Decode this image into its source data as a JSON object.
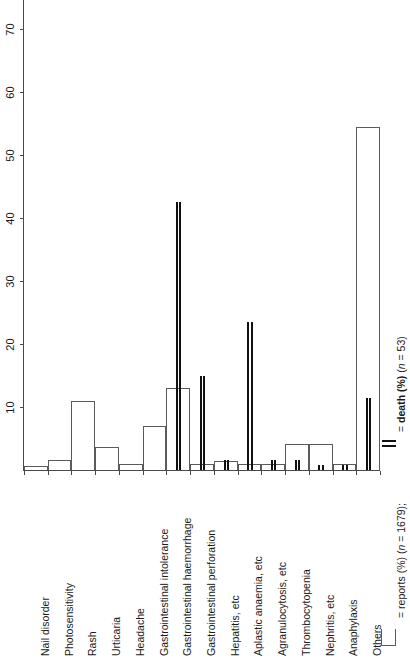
{
  "chart_data": {
    "type": "bar",
    "orientation": "vertical-bars-rotated-labels",
    "title": "",
    "subtitle": "",
    "xlabel": "",
    "ylabel": "",
    "ylim": [
      0,
      75
    ],
    "yticks": [
      10,
      20,
      30,
      40,
      50,
      60,
      70
    ],
    "ytick_labels": [
      "10",
      "20",
      "30",
      "40",
      "50",
      "60",
      "70"
    ],
    "grid": false,
    "legend_position": "bottom-right",
    "categories": [
      "Nail disorder",
      "Photosensitivity",
      "Rash",
      "Urticaria",
      "Headache",
      "Gastrointestinal intolerance",
      "Gastrointestinal haemorrhage",
      "Gastrointestinal perforation",
      "Hepatitis, etc",
      "Aplastic anaemia, etc",
      "Agranulocytosis, etc",
      "Thrombocytopenia",
      "Nephritis, etc",
      "Anaphylaxis",
      "Others"
    ],
    "series": [
      {
        "name": "reports (%) (n = 1679)",
        "style": "open-bar",
        "values": [
          0.6,
          1.6,
          11.0,
          3.6,
          1.0,
          7.0,
          13.0,
          1.0,
          1.4,
          1.0,
          1.0,
          4.2,
          4.2,
          1.0,
          54.5
        ]
      },
      {
        "name": "death (%) (n = 53)",
        "style": "thick-vertical-line",
        "values": [
          0,
          0,
          0,
          0,
          0,
          0,
          42.5,
          15.0,
          1.6,
          23.5,
          1.6,
          1.6,
          0.8,
          0.8,
          11.5
        ]
      }
    ],
    "legend_entries": [
      {
        "marker": "open-box",
        "text": "= reports (%) (n = 1679);"
      },
      {
        "marker": "double-line",
        "text": "= death (%) (n = 53)"
      }
    ]
  },
  "legend": {
    "reports_prefix": "= reports (%) (",
    "reports_n_italic": "n",
    "reports_n_value": " = 1679);",
    "death_prefix": "= ",
    "death_bold": "death (%)",
    "death_open": " (",
    "death_n_italic": "n",
    "death_n_value": " = 53)"
  }
}
